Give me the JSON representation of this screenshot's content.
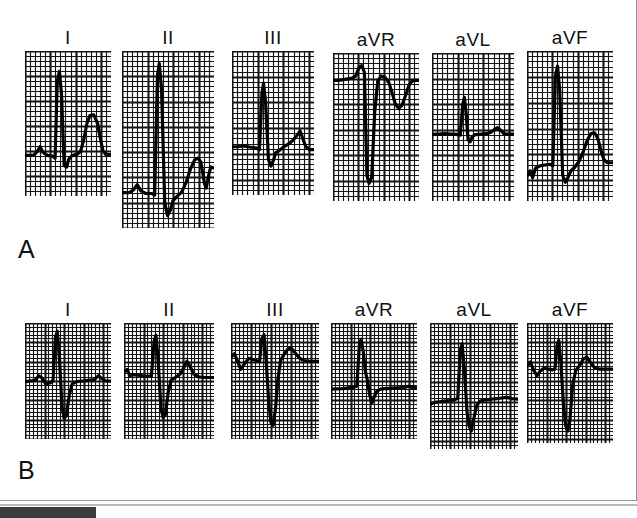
{
  "figure": {
    "panels": [
      {
        "id": "A",
        "letter": "A",
        "leads": [
          {
            "label": "I",
            "x": 25,
            "y": 55,
            "w": 86,
            "h": 145,
            "baseline": 0.72,
            "cols": 17,
            "rows": 29,
            "description": "tall-R-with-upright-T",
            "wave": "M0,0.72 L0.10,0.72 L0.14,0.695 L0.175,0.66 L0.21,0.70 L0.26,0.72 L0.32,0.725 L0.35,0.74 L0.375,0.21 L0.40,0.14 L0.425,0.30 L0.455,0.79 L0.485,0.80 L0.51,0.745 L0.55,0.72 L0.60,0.715 L0.645,0.695 L0.68,0.62 L0.72,0.50 L0.755,0.445 L0.80,0.44 L0.845,0.50 L0.875,0.60 L0.905,0.685 L0.94,0.715 L1.0,0.715"
          },
          {
            "label": "II",
            "x": 122,
            "y": 55,
            "w": 92,
            "h": 177,
            "baseline": 0.8,
            "cols": 18,
            "rows": 35,
            "description": "very-tall-R-deep-S-upright-T",
            "wave": "M0,0.80 L0.08,0.80 L0.125,0.785 L0.165,0.755 L0.205,0.79 L0.26,0.805 L0.325,0.805 L0.355,0.815 L0.385,0.14 L0.405,0.07 L0.43,0.22 L0.465,0.86 L0.495,0.93 L0.525,0.90 L0.555,0.845 L0.60,0.82 L0.645,0.80 L0.695,0.745 L0.745,0.665 L0.79,0.615 L0.825,0.605 L0.855,0.625 L0.875,0.68 L0.895,0.745 L0.915,0.775 L0.945,0.695 L0.965,0.655 L0.99,0.66"
          },
          {
            "label": "III",
            "x": 232,
            "y": 55,
            "w": 82,
            "h": 144,
            "baseline": 0.66,
            "cols": 16,
            "rows": 28,
            "description": "tall-R-small-S-upright-T",
            "wave": "M0,0.665 L0.08,0.665 L0.135,0.66 L0.19,0.665 L0.25,0.67 L0.30,0.675 L0.335,0.685 L0.365,0.29 L0.385,0.225 L0.41,0.36 L0.445,0.755 L0.475,0.80 L0.505,0.76 L0.535,0.705 L0.58,0.69 L0.635,0.665 L0.69,0.645 L0.745,0.62 L0.795,0.585 L0.83,0.555 L0.865,0.61 L0.90,0.665 L0.945,0.685 L1.0,0.685"
          },
          {
            "label": "aVR",
            "x": 333,
            "y": 57,
            "w": 86,
            "h": 148,
            "baseline": 0.18,
            "cols": 17,
            "rows": 29,
            "description": "deep-QS-inverted-T",
            "wave": "M0,0.185 L0.065,0.185 L0.12,0.18 L0.175,0.175 L0.225,0.17 L0.265,0.155 L0.30,0.10 L0.335,0.085 L0.365,0.13 L0.395,0.83 L0.42,0.88 L0.45,0.84 L0.485,0.40 L0.52,0.19 L0.56,0.155 L0.605,0.165 L0.65,0.20 L0.69,0.275 L0.725,0.345 L0.765,0.375 L0.805,0.35 L0.845,0.285 L0.885,0.215 L0.93,0.185 L1.0,0.185"
          },
          {
            "label": "aVL",
            "x": 432,
            "y": 57,
            "w": 82,
            "h": 148,
            "baseline": 0.545,
            "cols": 16,
            "rows": 29,
            "description": "small-R-flat-baseline",
            "wave": "M0,0.55 L0.08,0.548 L0.16,0.545 L0.24,0.548 L0.30,0.55 L0.345,0.555 L0.375,0.345 L0.395,0.30 L0.415,0.40 L0.44,0.585 L0.465,0.60 L0.49,0.565 L0.53,0.552 L0.60,0.548 L0.67,0.545 L0.72,0.535 L0.765,0.515 L0.80,0.505 L0.835,0.52 L0.875,0.545 L0.925,0.548 L1.0,0.548"
          },
          {
            "label": "aVF",
            "x": 527,
            "y": 55,
            "w": 86,
            "h": 150,
            "baseline": 0.76,
            "cols": 17,
            "rows": 29,
            "description": "tall-R-upright-T",
            "wave": "M0,0.835 L0.035,0.80 L0.065,0.845 L0.10,0.78 L0.155,0.765 L0.21,0.76 L0.265,0.755 L0.30,0.765 L0.33,0.165 L0.355,0.10 L0.38,0.26 L0.415,0.83 L0.445,0.875 L0.475,0.845 L0.51,0.80 L0.555,0.775 L0.605,0.735 L0.655,0.67 L0.70,0.595 L0.745,0.55 L0.785,0.545 L0.825,0.585 L0.86,0.665 L0.895,0.725 L0.935,0.745 L1.0,0.745"
          }
        ]
      },
      {
        "id": "B",
        "letter": "B",
        "leads": [
          {
            "label": "I",
            "x": 25,
            "y": 327,
            "w": 86,
            "h": 116,
            "baseline": 0.5,
            "cols": 22,
            "rows": 30,
            "description": "RS-with-deep-S",
            "wave": "M0,0.505 L0.06,0.50 L0.115,0.495 L0.16,0.455 L0.20,0.475 L0.245,0.53 L0.29,0.515 L0.325,0.50 L0.355,0.12 L0.375,0.07 L0.40,0.30 L0.43,0.72 L0.455,0.82 L0.48,0.80 L0.515,0.62 L0.55,0.525 L0.60,0.505 L0.67,0.50 L0.74,0.495 L0.80,0.49 L0.855,0.455 L0.895,0.48 L0.94,0.50 L1.0,0.50"
          },
          {
            "label": "II",
            "x": 124,
            "y": 327,
            "w": 90,
            "h": 116,
            "baseline": 0.46,
            "cols": 23,
            "rows": 30,
            "description": "RS-deep-S-with-notched-T",
            "wave": "M0,0.425 L0.035,0.40 L0.065,0.455 L0.10,0.445 L0.155,0.45 L0.21,0.455 L0.265,0.46 L0.305,0.455 L0.335,0.155 L0.355,0.105 L0.38,0.33 L0.41,0.73 L0.435,0.815 L0.46,0.79 L0.49,0.60 L0.525,0.49 L0.57,0.47 L0.625,0.44 L0.665,0.385 L0.70,0.33 L0.735,0.375 L0.775,0.44 L0.83,0.465 L0.89,0.47 L1.0,0.47"
          },
          {
            "label": "III",
            "x": 231,
            "y": 327,
            "w": 88,
            "h": 116,
            "baseline": 0.33,
            "cols": 22,
            "rows": 30,
            "description": "rS-very-deep-S-high-baseline",
            "wave": "M0,0.295 L0.04,0.265 L0.075,0.33 L0.11,0.40 L0.15,0.355 L0.20,0.305 L0.25,0.315 L0.295,0.325 L0.325,0.33 L0.35,0.135 L0.375,0.10 L0.40,0.33 L0.43,0.70 L0.455,0.86 L0.48,0.88 L0.505,0.74 L0.535,0.47 L0.565,0.32 L0.60,0.275 L0.645,0.225 L0.685,0.215 L0.725,0.255 L0.775,0.30 L0.83,0.325 L0.90,0.33 L1.0,0.33"
          },
          {
            "label": "aVR",
            "x": 331,
            "y": 327,
            "w": 86,
            "h": 116,
            "baseline": 0.565,
            "cols": 22,
            "rows": 30,
            "description": "upright-R-small-notch",
            "wave": "M0,0.57 L0.07,0.568 L0.14,0.565 L0.20,0.56 L0.255,0.555 L0.30,0.545 L0.33,0.19 L0.35,0.14 L0.375,0.245 L0.40,0.42 L0.425,0.50 L0.45,0.62 L0.475,0.69 L0.50,0.64 L0.535,0.585 L0.58,0.57 L0.645,0.565 L0.715,0.562 L0.785,0.558 L0.855,0.555 L0.90,0.545 L0.945,0.555 L1.0,0.56"
          },
          {
            "label": "aVL",
            "x": 430,
            "y": 327,
            "w": 88,
            "h": 126,
            "baseline": 0.62,
            "cols": 22,
            "rows": 32,
            "description": "tall-R-deep-S",
            "wave": "M0,0.645 L0.05,0.63 L0.105,0.625 L0.16,0.62 L0.22,0.615 L0.275,0.61 L0.315,0.60 L0.345,0.215 L0.365,0.165 L0.39,0.36 L0.42,0.70 L0.445,0.82 L0.47,0.855 L0.495,0.77 L0.53,0.655 L0.57,0.62 L0.625,0.61 L0.69,0.605 L0.755,0.60 L0.815,0.595 L0.87,0.59 L0.93,0.60 L1.0,0.605"
          },
          {
            "label": "aVF",
            "x": 527,
            "y": 327,
            "w": 86,
            "h": 120,
            "baseline": 0.39,
            "cols": 22,
            "rows": 31,
            "description": "rS-deep-S-notched-baseline",
            "wave": "M0,0.36 L0.04,0.325 L0.075,0.39 L0.115,0.44 L0.155,0.40 L0.20,0.375 L0.25,0.385 L0.295,0.39 L0.325,0.385 L0.35,0.185 L0.37,0.145 L0.395,0.34 L0.425,0.70 L0.45,0.855 L0.475,0.90 L0.50,0.80 L0.53,0.52 L0.565,0.40 L0.61,0.355 L0.655,0.30 L0.695,0.285 L0.735,0.325 L0.785,0.37 L0.845,0.385 L0.91,0.385 L1.0,0.385"
          }
        ]
      }
    ]
  },
  "chart_data": {
    "type": "line",
    "subtitle": "Two ECG recordings (A and B) of the six limb leads",
    "xlabel": "Time",
    "ylabel": "Voltage",
    "grid": "ecg-graph-paper (1 mm small squares, 5 mm bold squares)",
    "legend": "none",
    "panel_labels": [
      "A",
      "B"
    ],
    "lead_labels": [
      "I",
      "II",
      "III",
      "aVR",
      "aVL",
      "aVF"
    ],
    "series": [
      {
        "name": "A-I",
        "panel": "A",
        "lead": "I",
        "qrs_axis_contribution": "positive",
        "features": {
          "P": "small upright",
          "Q": "small",
          "R": "tall positive",
          "S": "small",
          "T": "upright prominent"
        }
      },
      {
        "name": "A-II",
        "panel": "A",
        "lead": "II",
        "qrs_axis_contribution": "strongly positive",
        "features": {
          "P": "small upright",
          "Q": "none",
          "R": "very tall positive",
          "S": "deep",
          "T": "upright prominent"
        }
      },
      {
        "name": "A-III",
        "panel": "A",
        "lead": "III",
        "qrs_axis_contribution": "positive",
        "features": {
          "P": "flat",
          "Q": "none",
          "R": "tall positive",
          "S": "small",
          "T": "upright"
        }
      },
      {
        "name": "A-aVR",
        "panel": "A",
        "lead": "aVR",
        "qrs_axis_contribution": "negative",
        "features": {
          "P": "inverted",
          "Q": "none",
          "R": "none",
          "S": "deep QS negative",
          "T": "inverted"
        }
      },
      {
        "name": "A-aVL",
        "panel": "A",
        "lead": "aVL",
        "qrs_axis_contribution": "isoelectric",
        "features": {
          "P": "flat",
          "Q": "none",
          "R": "small positive",
          "S": "small",
          "T": "flat"
        }
      },
      {
        "name": "A-aVF",
        "panel": "A",
        "lead": "aVF",
        "qrs_axis_contribution": "strongly positive",
        "features": {
          "P": "small",
          "Q": "none",
          "R": "tall positive",
          "S": "small",
          "T": "upright prominent"
        }
      },
      {
        "name": "B-I",
        "panel": "B",
        "lead": "I",
        "qrs_axis_contribution": "negative",
        "features": {
          "P": "small",
          "Q": "none",
          "R": "moderate positive",
          "S": "deep",
          "T": "low upright"
        }
      },
      {
        "name": "B-II",
        "panel": "B",
        "lead": "II",
        "qrs_axis_contribution": "negative",
        "features": {
          "P": "small",
          "Q": "none",
          "R": "moderate positive",
          "S": "deep",
          "T": "upright"
        }
      },
      {
        "name": "B-III",
        "panel": "B",
        "lead": "III",
        "qrs_axis_contribution": "strongly negative",
        "features": {
          "P": "biphasic",
          "Q": "none",
          "R": "small positive",
          "S": "very deep",
          "T": "upright"
        }
      },
      {
        "name": "B-aVR",
        "panel": "B",
        "lead": "aVR",
        "qrs_axis_contribution": "positive",
        "features": {
          "P": "flat",
          "Q": "none",
          "R": "tall positive",
          "S": "small",
          "T": "flat"
        }
      },
      {
        "name": "B-aVL",
        "panel": "B",
        "lead": "aVL",
        "qrs_axis_contribution": "negative",
        "features": {
          "P": "flat",
          "Q": "none",
          "R": "tall positive",
          "S": "deep",
          "T": "flat"
        }
      },
      {
        "name": "B-aVF",
        "panel": "B",
        "lead": "aVF",
        "qrs_axis_contribution": "strongly negative",
        "features": {
          "P": "biphasic",
          "Q": "none",
          "R": "small positive",
          "S": "very deep",
          "T": "upright"
        }
      }
    ],
    "colors": {
      "background": "#ffffff",
      "grid": "#1a1a1a",
      "trace": "#000000",
      "label_text": "#111111"
    }
  }
}
